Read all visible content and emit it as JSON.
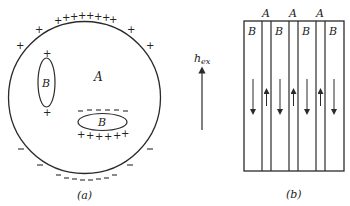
{
  "colors": {
    "ink": "#2a2a2a",
    "background": "#ffffff"
  },
  "panel_a": {
    "caption": "(a)",
    "matrix_label": "A",
    "domain_vertical_label": "B",
    "domain_horizontal_label": "B",
    "plus": "+",
    "minus": "−"
  },
  "field": {
    "label_main": "h",
    "label_sub": "ex"
  },
  "panel_b": {
    "caption": "(b)",
    "stripe_labels_A": [
      "A",
      "A",
      "A"
    ],
    "stripe_labels_B": [
      "B",
      "B",
      "B",
      "B"
    ]
  }
}
